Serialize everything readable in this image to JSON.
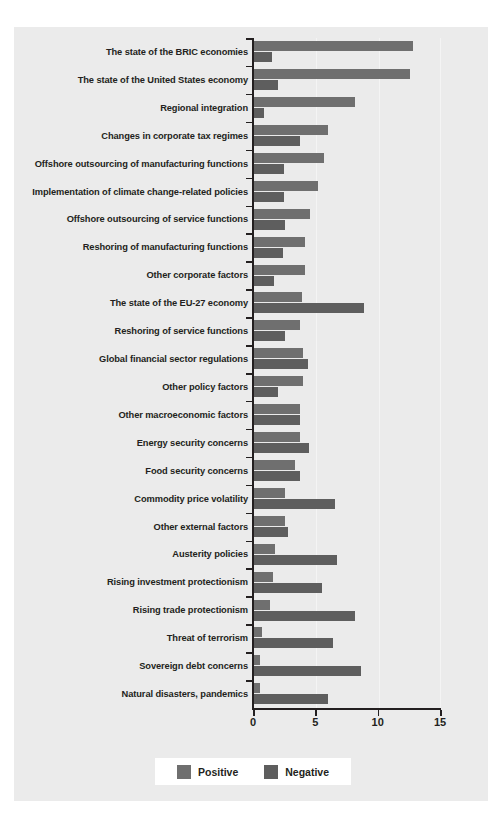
{
  "chart_data": {
    "type": "bar",
    "orientation": "horizontal",
    "title": "",
    "xlabel": "",
    "ylabel": "",
    "xlim": [
      0,
      15
    ],
    "xticks": [
      "0",
      "5",
      "10",
      "15"
    ],
    "xtick_values": [
      0,
      5,
      10,
      15
    ],
    "grid": true,
    "legend_position": "bottom",
    "categories": [
      "The state of the BRIC economies",
      "The state of the United States economy",
      "Regional integration",
      "Changes in corporate tax regimes",
      "Offshore outsourcing of manufacturing functions",
      "Implementation of climate change-related policies",
      "Offshore outsourcing of service functions",
      "Reshoring of manufacturing functions",
      "Other corporate factors",
      "The state of the EU-27 economy",
      "Reshoring of service functions",
      "Global financial sector regulations",
      "Other policy factors",
      "Other macroeconomic factors",
      "Energy security concerns",
      "Food security concerns",
      "Commodity price volatility",
      "Other external factors",
      "Austerity policies",
      "Rising investment protectionism",
      "Rising trade protectionism",
      "Threat of terrorism",
      "Sovereign debt concerns",
      "Natural disasters, pandemics"
    ],
    "series": [
      {
        "name": "Positive",
        "color": "#6f6f6f",
        "values": [
          12.8,
          12.6,
          8.2,
          6.0,
          5.7,
          5.2,
          4.6,
          4.2,
          4.2,
          3.9,
          3.8,
          4.0,
          4.0,
          3.8,
          3.8,
          3.4,
          2.6,
          2.6,
          1.8,
          1.6,
          1.4,
          0.7,
          0.6,
          0.6
        ]
      },
      {
        "name": "Negative",
        "color": "#5e5e5e",
        "values": [
          1.5,
          2.0,
          0.9,
          3.8,
          2.5,
          2.5,
          2.6,
          2.4,
          1.7,
          8.9,
          2.6,
          4.4,
          2.0,
          3.8,
          4.5,
          3.8,
          6.6,
          2.8,
          6.7,
          5.5,
          8.2,
          6.4,
          8.7,
          6.0
        ]
      }
    ]
  },
  "legend": {
    "items": [
      {
        "label": "Positive",
        "color": "#6f6f6f"
      },
      {
        "label": "Negative",
        "color": "#5e5e5e"
      }
    ]
  },
  "colors": {
    "panel_background": "#ebebeb",
    "page_background": "#ffffff",
    "axis": "#231f20",
    "gridline": "#f4f4f4",
    "positive": "#6f6f6f",
    "negative": "#5e5e5e"
  }
}
